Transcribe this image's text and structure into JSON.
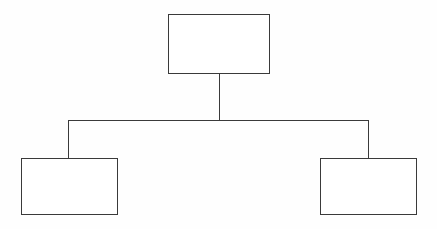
{
  "diagram": {
    "type": "organizational-chart",
    "orientation": "top-down",
    "line_color": "#3a3a3a",
    "box_fill": "#ffffff",
    "text_color": "#1c1c1c",
    "background": "#fefefe",
    "nodes": [
      {
        "id": "mis-manager",
        "label": "MIS\nManager",
        "label_lines": [
          "MIS",
          "Manager"
        ],
        "level": 0,
        "position": "top-center"
      },
      {
        "id": "operations",
        "label": "Operations",
        "label_lines": [
          "Operations"
        ],
        "level": 1,
        "position": "bottom-left"
      },
      {
        "id": "systems-and-programming",
        "label": "Systems and\nProgramming",
        "label_lines": [
          "Systems and",
          "Programming"
        ],
        "level": 1,
        "position": "bottom-right"
      }
    ],
    "edges": [
      {
        "from": "mis-manager",
        "to": "operations",
        "style": "elbow"
      },
      {
        "from": "mis-manager",
        "to": "systems-and-programming",
        "style": "elbow"
      }
    ]
  }
}
